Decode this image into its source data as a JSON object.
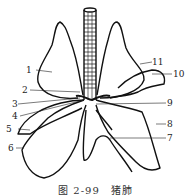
{
  "caption": "图 2-99　猪肺",
  "labels": {
    "l1": "1",
    "l2": "2",
    "l3": "3",
    "l4": "4",
    "l5": "5",
    "l6": "6",
    "l7": "7",
    "l8": "8",
    "l9": "9",
    "l10": "10",
    "l11": "11"
  }
}
